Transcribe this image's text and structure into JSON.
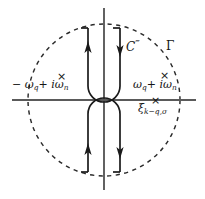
{
  "figure": {
    "background_color": "#ffffff",
    "stroke_color": "#1a1a1a",
    "axis_color": "#555555",
    "width": 205,
    "height": 199
  },
  "axes": {
    "real_axis": {
      "label": "",
      "y": 100,
      "x_start": 12,
      "x_end": 196
    },
    "imaginary_axis": {
      "label": "",
      "x": 104,
      "y_start": 8,
      "y_end": 190
    }
  },
  "contour": {
    "gamma_label": "Γ",
    "inner_contour_label": "C",
    "inner_contour_primes": "‴",
    "circle": {
      "center_x": 104,
      "center_y": 100,
      "radius": 76,
      "style": "dashed"
    },
    "arrows": [
      {
        "name": "upper-left-branch",
        "direction": "up"
      },
      {
        "name": "upper-right-branch",
        "direction": "down"
      },
      {
        "name": "lower-left-branch",
        "direction": "up"
      },
      {
        "name": "lower-right-branch",
        "direction": "down"
      }
    ]
  },
  "poles": [
    {
      "name": "pole-upper-left",
      "marker": "×",
      "label_prefix": "− ω",
      "label_sub1": "q",
      "label_mid": " + ",
      "label_i": "i",
      "label_omega": "ω",
      "label_sub2": "n",
      "full_text": "−ω_q + iω_n"
    },
    {
      "name": "pole-upper-right",
      "marker": "×",
      "label_prefix": "ω",
      "label_sub1": "q",
      "label_mid": " + ",
      "label_i": "i",
      "label_omega": "ω",
      "label_sub2": "n",
      "full_text": "ω_q + iω_n"
    },
    {
      "name": "pole-real-axis",
      "marker": "×",
      "label_symbol": "ξ",
      "label_sub": "k−q,σ",
      "full_text": "ξ_{k−q,σ}"
    }
  ],
  "labels": {
    "left_pole": {
      "minus_omega": "− ω",
      "sub_q": "q",
      "plus": "+ ",
      "i": "i",
      "omega": "ω",
      "sub_n": "n"
    },
    "right_pole": {
      "omega": "ω",
      "sub_q": "q",
      "plus": "+ ",
      "i": "i",
      "omega2": "ω",
      "sub_n": "n"
    },
    "xi": {
      "symbol": "ξ",
      "subscript": "k−q,σ"
    },
    "contour_c": "C",
    "contour_primes": "‴",
    "gamma": "Γ"
  }
}
